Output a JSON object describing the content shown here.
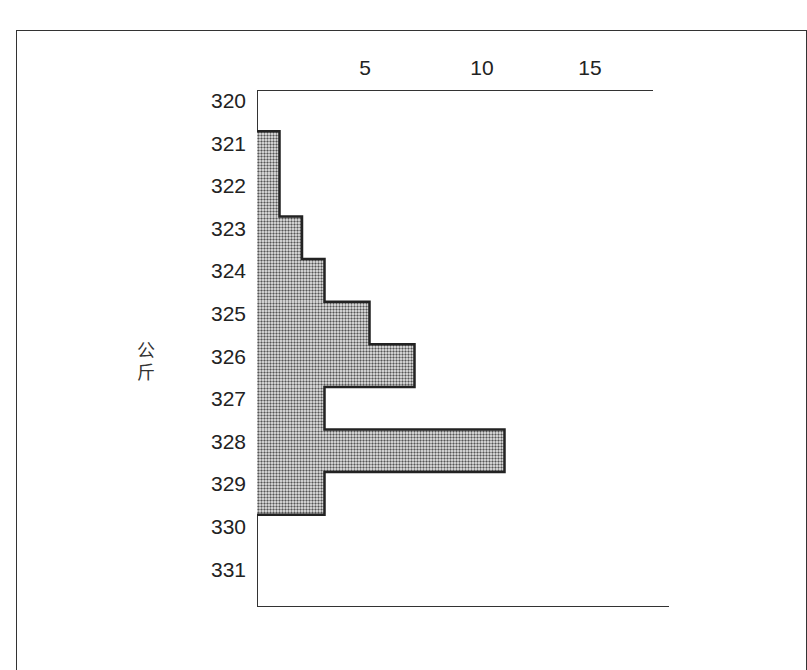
{
  "chart_data": {
    "type": "bar",
    "orientation": "horizontal",
    "title": "",
    "xlabel": "",
    "ylabel": "公斤",
    "x_ticks": [
      "5",
      "10",
      "15"
    ],
    "y_ticks": [
      "320",
      "321",
      "322",
      "323",
      "324",
      "325",
      "326",
      "327",
      "328",
      "329",
      "330",
      "331"
    ],
    "categories": [
      "321",
      "322",
      "323",
      "324",
      "325",
      "326",
      "327",
      "328",
      "329"
    ],
    "values": [
      1,
      1,
      2,
      3,
      5,
      7,
      3,
      11,
      3
    ],
    "xlim": [
      0,
      18
    ],
    "grid": false,
    "legend": null
  },
  "labels": {
    "ylabel_line1": "公",
    "ylabel_line2": "斤",
    "x5": "5",
    "x10": "10",
    "x15": "15"
  }
}
